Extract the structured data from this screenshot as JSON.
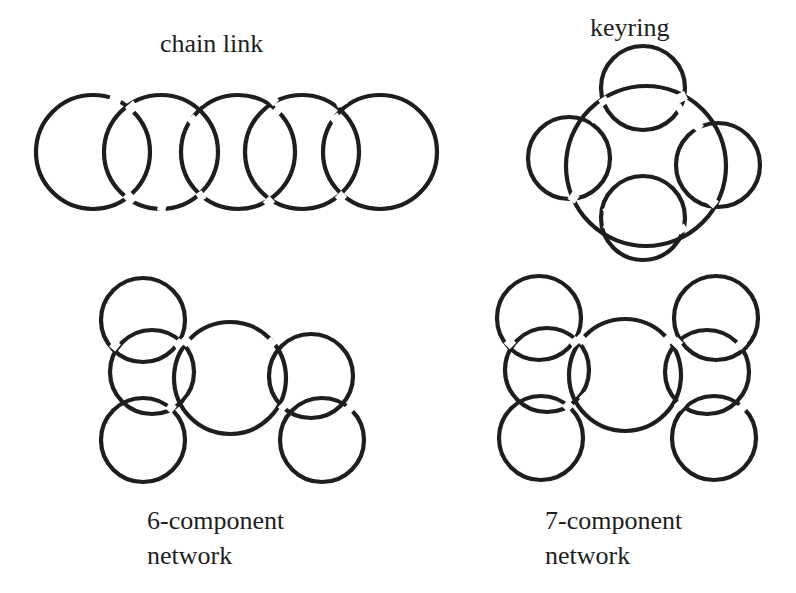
{
  "figure": {
    "background": "#ffffff",
    "stroke_color": "#1e1e1e",
    "panels": [
      {
        "id": "chain-link",
        "label": "chain link",
        "components": 5,
        "rings": [
          {
            "cx": 93,
            "cy": 152,
            "r": 57
          },
          {
            "cx": 161,
            "cy": 152,
            "r": 57
          },
          {
            "cx": 238,
            "cy": 152,
            "r": 57
          },
          {
            "cx": 302,
            "cy": 152,
            "r": 57
          },
          {
            "cx": 380,
            "cy": 152,
            "r": 57
          }
        ]
      },
      {
        "id": "keyring",
        "label": "keyring",
        "components": 5,
        "rings": [
          {
            "cx": 646,
            "cy": 166,
            "r": 80,
            "role": "key-ring"
          },
          {
            "cx": 643,
            "cy": 88,
            "r": 42
          },
          {
            "cx": 569,
            "cy": 158,
            "r": 41
          },
          {
            "cx": 718,
            "cy": 165,
            "r": 42
          },
          {
            "cx": 643,
            "cy": 218,
            "r": 42
          }
        ]
      },
      {
        "id": "six-component-network",
        "label_line1": "6-component",
        "label_line2": "network",
        "components": 6,
        "rings": [
          {
            "cx": 143,
            "cy": 320,
            "r": 42
          },
          {
            "cx": 152,
            "cy": 372,
            "r": 42
          },
          {
            "cx": 143,
            "cy": 440,
            "r": 42
          },
          {
            "cx": 230,
            "cy": 378,
            "r": 56,
            "role": "hub"
          },
          {
            "cx": 311,
            "cy": 376,
            "r": 42
          },
          {
            "cx": 322,
            "cy": 440,
            "r": 42
          }
        ]
      },
      {
        "id": "seven-component-network",
        "label_line1": "7-component",
        "label_line2": "network",
        "components": 7,
        "rings": [
          {
            "cx": 539,
            "cy": 318,
            "r": 42
          },
          {
            "cx": 547,
            "cy": 370,
            "r": 42
          },
          {
            "cx": 541,
            "cy": 438,
            "r": 42
          },
          {
            "cx": 625,
            "cy": 375,
            "r": 56,
            "role": "hub"
          },
          {
            "cx": 716,
            "cy": 318,
            "r": 42
          },
          {
            "cx": 707,
            "cy": 372,
            "r": 42
          },
          {
            "cx": 714,
            "cy": 438,
            "r": 42
          }
        ]
      }
    ]
  }
}
